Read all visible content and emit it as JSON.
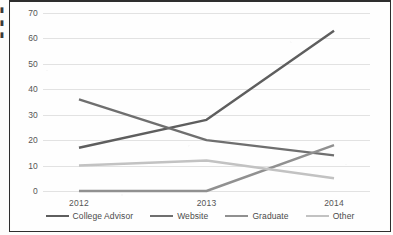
{
  "document": {
    "margin_fragments": [
      "▮",
      "▮",
      "▮"
    ]
  },
  "chart_data": {
    "type": "line",
    "title": "",
    "xlabel": "",
    "ylabel": "",
    "categories": [
      "2012",
      "2013",
      "2014"
    ],
    "x_tick_labels": [
      "2012",
      "2013",
      "2014"
    ],
    "y_tick_labels": [
      "0",
      "10",
      "20",
      "30",
      "40",
      "50",
      "60",
      "70"
    ],
    "y_ticks": [
      0,
      10,
      20,
      30,
      40,
      50,
      60,
      70
    ],
    "ylim": [
      0,
      70
    ],
    "grid": true,
    "grid_axis": "y",
    "legend": true,
    "legend_position": "bottom",
    "series": [
      {
        "name": "College Advisor",
        "values": [
          17,
          28,
          63
        ],
        "color": "#5e5e5e"
      },
      {
        "name": "Website",
        "values": [
          36,
          20,
          14
        ],
        "color": "#6f6f6f"
      },
      {
        "name": "Graduate",
        "values": [
          0,
          0,
          18
        ],
        "color": "#909090"
      },
      {
        "name": "Other",
        "values": [
          10,
          12,
          5
        ],
        "color": "#c2c2c2"
      }
    ]
  }
}
